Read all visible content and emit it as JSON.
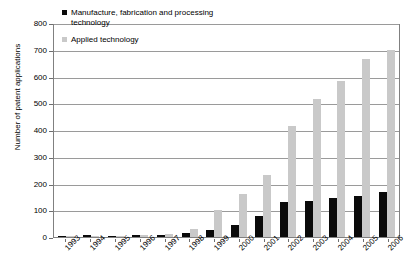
{
  "chart_data": {
    "type": "bar",
    "title": "",
    "subtitle": "",
    "xlabel": "",
    "ylabel": "Number of patent applications",
    "ylim": [
      0,
      800
    ],
    "ytick_step": 100,
    "yticks": [
      "800",
      "700",
      "600",
      "500",
      "400",
      "300",
      "200",
      "100",
      "0"
    ],
    "grid": true,
    "legend_position": "top-left-inside",
    "categories": [
      "1993",
      "1994",
      "1995",
      "1996",
      "1997",
      "1998",
      "1999",
      "2000",
      "2001",
      "2002",
      "2003",
      "2004",
      "2005",
      "2006"
    ],
    "series": [
      {
        "name": "Manufacture, fabrication and processing technology",
        "color": "#0a0a0a",
        "values": [
          5,
          6,
          4,
          6,
          7,
          15,
          28,
          45,
          80,
          130,
          135,
          145,
          155,
          170
        ]
      },
      {
        "name": "Applied technology",
        "color": "#c9c9c9",
        "values": [
          4,
          3,
          3,
          7,
          12,
          30,
          100,
          160,
          230,
          415,
          515,
          585,
          665,
          700
        ]
      }
    ]
  },
  "axes": {
    "y_title": "Number of patent applications"
  },
  "legend": {
    "items": [
      {
        "label": "Manufacture, fabrication and processing technology",
        "color": "#0a0a0a"
      },
      {
        "label": "Applied technology",
        "color": "#c9c9c9"
      }
    ]
  }
}
